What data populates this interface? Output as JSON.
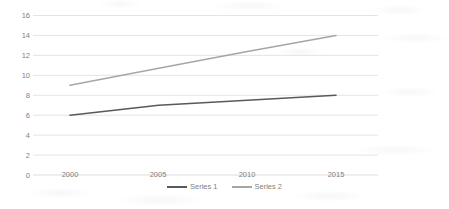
{
  "chart_data": {
    "type": "line",
    "title": "",
    "subtitle": "",
    "xlabel": "",
    "ylabel": "",
    "x": [
      2000,
      2005,
      2010,
      2015
    ],
    "categories": [
      "2000",
      "2005",
      "2010",
      "2015"
    ],
    "series": [
      {
        "name": "Series 1",
        "values": [
          6,
          7,
          7.5,
          8
        ],
        "color": "#595959"
      },
      {
        "name": "Series 2",
        "values": [
          9,
          10.7,
          12.4,
          14
        ],
        "color": "#a6a6a6"
      }
    ],
    "ylim": [
      0,
      16
    ],
    "xlim": [
      2000,
      2015
    ],
    "y_ticks": [
      0,
      2,
      4,
      6,
      8,
      10,
      12,
      14,
      16
    ],
    "y_tick_labels": [
      "0",
      "2",
      "4",
      "6",
      "8",
      "10",
      "12",
      "14",
      "16"
    ],
    "x_ticks": [
      2000,
      2005,
      2010,
      2015
    ],
    "x_tick_labels": [
      "2000",
      "2005",
      "2010",
      "2015"
    ],
    "grid": true,
    "grid_axis": "y",
    "grid_color": "#d9d9d9",
    "legend": true,
    "legend_position": "bottom",
    "background_color": "#ffffff",
    "tick_label_color": "#7f7f7f"
  }
}
